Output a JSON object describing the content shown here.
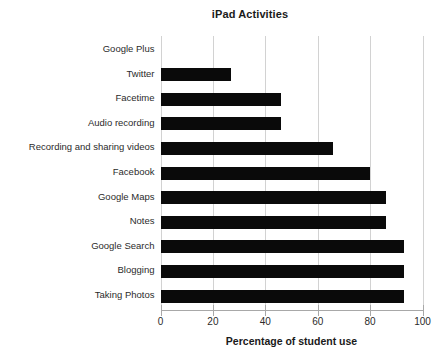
{
  "chart_data": {
    "type": "bar",
    "orientation": "horizontal",
    "title": "iPad Activities",
    "xlabel": "Percentage of student use",
    "ylabel": "",
    "xlim": [
      0,
      100
    ],
    "xticks": [
      0,
      20,
      40,
      60,
      80,
      100
    ],
    "xtick_labels": [
      "0",
      "20",
      "40",
      "60",
      "80",
      "100"
    ],
    "grid": true,
    "legend": null,
    "bar_color": "#0a0a0a",
    "categories": [
      "Google Plus",
      "Twitter",
      "Facetime",
      "Audio recording",
      "Recording and sharing videos",
      "Facebook",
      "Google Maps",
      "Notes",
      "Google Search",
      "Blogging",
      "Taking Photos"
    ],
    "values": [
      0,
      27,
      46,
      46,
      66,
      80,
      86,
      86,
      93,
      93,
      93
    ]
  }
}
